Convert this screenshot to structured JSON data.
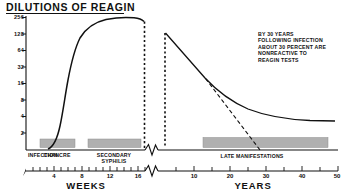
{
  "chart_data": {
    "type": "line",
    "title": "DILUTIONS OF REAGIN",
    "xlabel_left": "WEEKS",
    "xlabel_right": "YEARS",
    "ylabel": "",
    "yscale": "log2",
    "yticks": [
      256,
      128,
      64,
      32,
      16,
      8,
      4,
      2
    ],
    "ylim": [
      1,
      360
    ],
    "axis_break": true,
    "xticks_weeks": [
      1,
      2,
      3,
      4,
      5,
      6,
      7,
      8,
      9,
      10,
      11,
      12,
      13,
      14,
      15,
      16,
      17
    ],
    "xticklabels_weeks": [
      4,
      8,
      12,
      16
    ],
    "xlim_weeks": [
      0,
      17
    ],
    "xticks_years": [
      5,
      10,
      15,
      20,
      25,
      30,
      35,
      40,
      45,
      50
    ],
    "xticklabels_years": [
      10,
      20,
      30,
      40,
      50
    ],
    "xlim_years": [
      0,
      52
    ],
    "grid": false,
    "legend": "none",
    "annotations": [
      "BY 30 YEARS",
      "FOLLOWING INFECTION",
      "ABOUT 30 PERCENT ARE",
      "NONREACTIVE TO",
      "REAGIN TESTS"
    ],
    "phase_bars": [
      {
        "label": "CHANCRE",
        "panel": "weeks",
        "start": 2.3,
        "end": 6.2
      },
      {
        "label": "SECONDARY SYPHILIS",
        "panel": "weeks",
        "start": 7.6,
        "end": 13.4
      },
      {
        "label": "LATE MANIFESTATIONS",
        "panel": "years",
        "start": 4.0,
        "end": 40.0
      }
    ],
    "phase_markers": [
      {
        "label": "INFECTION",
        "panel": "weeks",
        "x": 0.2
      }
    ],
    "series": [
      {
        "name": "reagin-titer-primary-secondary",
        "panel": "weeks",
        "style": "solid",
        "x": [
          3.2,
          3.8,
          4.2,
          4.6,
          5.0,
          5.4,
          5.8,
          6.3,
          6.8,
          7.4,
          8.0,
          8.8,
          9.6,
          10.6,
          11.8,
          13.0,
          14.2,
          15.2,
          15.9
        ],
        "y": [
          1.1,
          1.6,
          2.4,
          3.6,
          5.6,
          9.0,
          15.0,
          26.0,
          45.0,
          74.0,
          112.0,
          160.0,
          200.0,
          232.0,
          254.0,
          266.0,
          262.0,
          248.0,
          236.0
        ]
      },
      {
        "name": "reagin-titer-late-treated-or-latent",
        "panel": "years",
        "style": "solid",
        "x": [
          0.6,
          3.0,
          6.0,
          9.0,
          12.0,
          14.0,
          16.0,
          19.0,
          23.0,
          28.0,
          34.0,
          41.0,
          48.0,
          52.0
        ],
        "y": [
          128.0,
          74.0,
          41.0,
          24.0,
          15.0,
          12.4,
          10.4,
          8.2,
          6.4,
          5.2,
          4.5,
          4.1,
          4.0,
          4.0
        ]
      },
      {
        "name": "reagin-titer-nonreactive-decline",
        "panel": "years",
        "style": "dashed",
        "x": [
          13.0,
          17.0,
          21.0,
          25.0,
          29.0,
          31.5
        ],
        "y": [
          13.5,
          8.6,
          5.2,
          3.1,
          1.8,
          1.25
        ]
      }
    ]
  }
}
